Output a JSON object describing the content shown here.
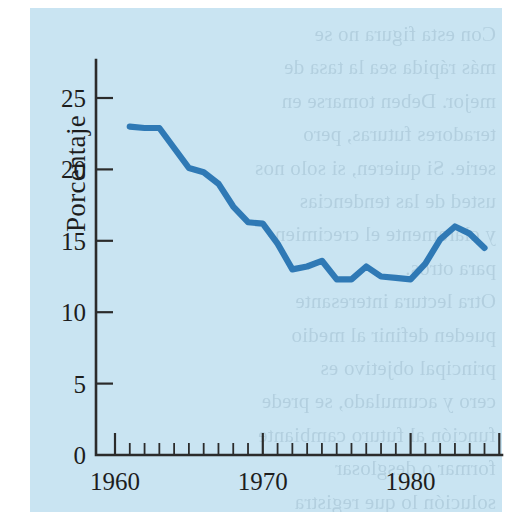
{
  "page": {
    "panel_color": "#c9e4f2",
    "paper_color": "#ffffff",
    "bleed_text": "Con esta figura no se\nmás rápida sea la tasa de\nmejor. Deben tomarse en\nteradores futuras, pero\nserie. Si quieren, si solo nos\nusted de las tendencias\ny claramente el crecimien-\npara otros.\nOtra lectura interesante\npueden definir al medio\nprincipal objetivo es\ncero y acumulado, se prede\nfunción al futuro cambiante\nformar o desglosar\nsolución lo que registra\nmidiendo la información"
  },
  "chart": {
    "y_axis_title": "Porcentaje",
    "x_axis_title": "",
    "y_tick_labels": [
      "0",
      "5",
      "10",
      "15",
      "20",
      "25"
    ],
    "x_tick_labels": [
      "1960",
      "1970",
      "1980"
    ],
    "line_color": "#2f79b5"
  },
  "chart_data": {
    "type": "line",
    "title": "",
    "xlabel": "",
    "ylabel": "Porcentaje",
    "xlim": [
      1959.0,
      1986.0
    ],
    "ylim": [
      0,
      27.5
    ],
    "xticks": [
      1960,
      1970,
      1980
    ],
    "xticks_minor": [
      1961,
      1962,
      1963,
      1964,
      1965,
      1966,
      1967,
      1968,
      1969,
      1971,
      1972,
      1973,
      1974,
      1975,
      1976,
      1977,
      1978,
      1979,
      1981,
      1982,
      1983,
      1984,
      1985
    ],
    "yticks": [
      0,
      5,
      10,
      15,
      20,
      25
    ],
    "grid": false,
    "legend": "none",
    "series": [
      {
        "name": "Porcentaje",
        "x": [
          1961,
          1962,
          1963,
          1964,
          1965,
          1966,
          1967,
          1968,
          1969,
          1970,
          1971,
          1972,
          1973,
          1974,
          1975,
          1976,
          1977,
          1978,
          1979,
          1980,
          1981,
          1982,
          1983,
          1984,
          1985
        ],
        "values": [
          23.0,
          22.9,
          22.9,
          21.5,
          20.1,
          19.8,
          19.0,
          17.4,
          16.3,
          16.2,
          14.8,
          13.0,
          13.2,
          13.6,
          12.3,
          12.3,
          13.2,
          12.5,
          12.4,
          12.3,
          13.4,
          15.1,
          16.0,
          15.5,
          14.5
        ]
      }
    ]
  }
}
